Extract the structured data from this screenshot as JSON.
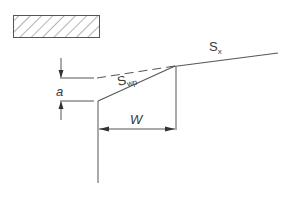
{
  "diagram": {
    "labels": {
      "dim_a": "a",
      "dim_w": "W",
      "sx_main": "S",
      "sx_sub": "x",
      "swp_main": "S",
      "swp_sub": "wp"
    },
    "elements": {
      "hatched_block": "fixed wall / support",
      "dashed_line": "extension of S_x line",
      "sx_line": "line S_x",
      "swp_line": "line S_wp",
      "dimension_a": "offset a between dashed extension and S_wp start",
      "dimension_w": "horizontal width W"
    },
    "colors": {
      "stroke": "#555555",
      "text": "#3a3a3a",
      "background": "#ffffff"
    }
  }
}
